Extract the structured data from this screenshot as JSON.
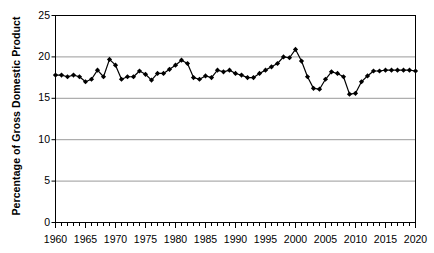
{
  "chart_data": {
    "type": "line",
    "title": "",
    "subtitle": "",
    "xlabel": "",
    "ylabel": "Percentage of Gross Domestic Product",
    "xlim": [
      1960,
      2020
    ],
    "ylim": [
      0,
      25
    ],
    "yticks": [
      0,
      5,
      10,
      15,
      20,
      25
    ],
    "ytick_labels": [
      "0",
      "5",
      "10",
      "15",
      "20",
      "25"
    ],
    "xticks": [
      1960,
      1965,
      1970,
      1975,
      1980,
      1985,
      1990,
      1995,
      2000,
      2005,
      2010,
      2015,
      2020
    ],
    "xtick_labels": [
      "1960",
      "1965",
      "1970",
      "1975",
      "1980",
      "1985",
      "1990",
      "1995",
      "2000",
      "2005",
      "2010",
      "2015",
      "2020"
    ],
    "minor_xtick_interval": 1,
    "grid": "horizontal",
    "legend": "none",
    "marker": "diamond",
    "line_color": "#000000",
    "marker_color": "#000000",
    "grid_color": "#808080",
    "axis_color": "#000000",
    "background": "#ffffff",
    "x": [
      1960,
      1961,
      1962,
      1963,
      1964,
      1965,
      1966,
      1967,
      1968,
      1969,
      1970,
      1971,
      1972,
      1973,
      1974,
      1975,
      1976,
      1977,
      1978,
      1979,
      1980,
      1981,
      1982,
      1983,
      1984,
      1985,
      1986,
      1987,
      1988,
      1989,
      1990,
      1991,
      1992,
      1993,
      1994,
      1995,
      1996,
      1997,
      1998,
      1999,
      2000,
      2001,
      2002,
      2003,
      2004,
      2005,
      2006,
      2007,
      2008,
      2009,
      2010,
      2011,
      2012,
      2013,
      2014,
      2015,
      2016,
      2017,
      2018,
      2019,
      2020
    ],
    "values": [
      17.8,
      17.8,
      17.6,
      17.8,
      17.6,
      17.0,
      17.3,
      18.4,
      17.6,
      19.7,
      19.0,
      17.3,
      17.6,
      17.6,
      18.3,
      17.9,
      17.2,
      18.0,
      18.0,
      18.5,
      19.0,
      19.6,
      19.2,
      17.5,
      17.3,
      17.7,
      17.5,
      18.4,
      18.2,
      18.4,
      18.0,
      17.8,
      17.5,
      17.5,
      18.0,
      18.4,
      18.8,
      19.2,
      20.0,
      19.9,
      20.9,
      19.5,
      17.6,
      16.2,
      16.1,
      17.3,
      18.2,
      18.0,
      17.6,
      15.5,
      15.6,
      17.0,
      17.7,
      18.3,
      18.3,
      18.4,
      18.4,
      18.4,
      18.4,
      18.4,
      18.3
    ],
    "annotations": []
  },
  "axes": {
    "ylabel_text": "Percentage of Gross Domestic Product"
  }
}
